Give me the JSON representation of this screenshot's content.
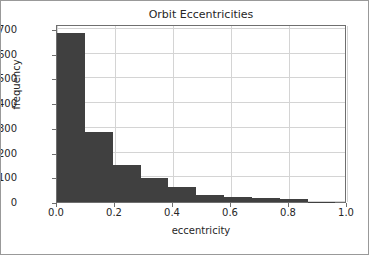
{
  "figure": {
    "background_color": "#ffffff",
    "border_color": "#999999",
    "axes_color": "#6f6f6f",
    "grid_color": "#d4d4d4",
    "text_color": "#262626"
  },
  "chart_data": {
    "type": "bar",
    "title": "Orbit Eccentricities",
    "xlabel": "eccentricity",
    "ylabel": "frequency",
    "bar_color": "#404040",
    "grid": true,
    "legend": null,
    "xlim": [
      0.0,
      1.0
    ],
    "ylim": [
      0,
      720
    ],
    "xticks": [
      "0.0",
      "0.2",
      "0.4",
      "0.6",
      "0.8",
      "1.0"
    ],
    "xtick_values": [
      0.0,
      0.2,
      0.4,
      0.6,
      0.8,
      1.0
    ],
    "yticks": [
      "0",
      "100",
      "200",
      "300",
      "400",
      "500",
      "600",
      "700"
    ],
    "ytick_values": [
      0,
      100,
      200,
      300,
      400,
      500,
      600,
      700
    ],
    "bin_edges": [
      0.0,
      0.096,
      0.192,
      0.288,
      0.384,
      0.48,
      0.576,
      0.672,
      0.768,
      0.864,
      0.96
    ],
    "values": [
      683,
      282,
      148,
      99,
      61,
      29,
      19,
      17,
      12,
      1
    ],
    "bin_centers": [
      0.048,
      0.144,
      0.24,
      0.336,
      0.432,
      0.528,
      0.624,
      0.72,
      0.816,
      0.912
    ]
  }
}
